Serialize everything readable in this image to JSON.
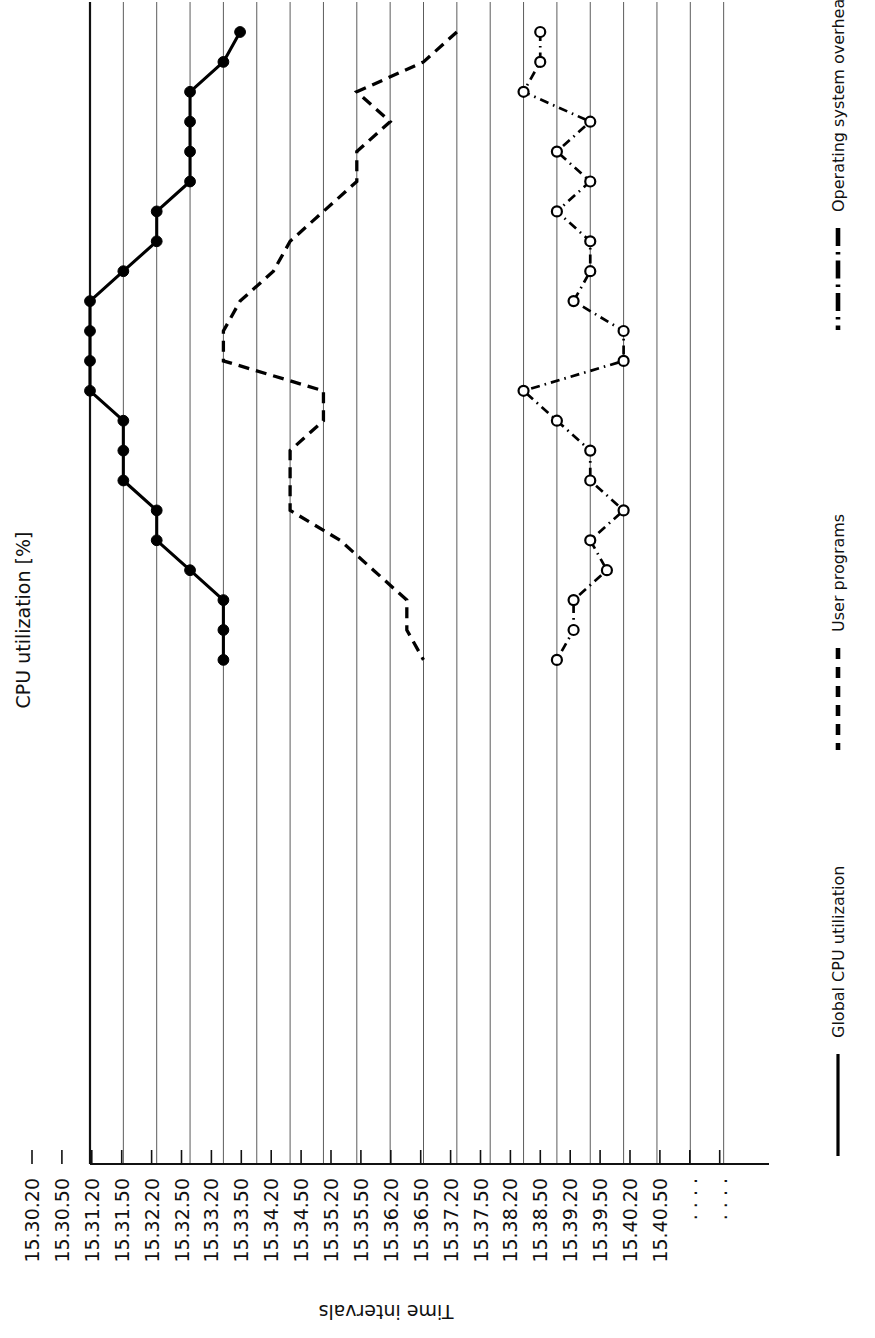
{
  "chart_data": {
    "type": "line",
    "title": "",
    "orientation": "rotated-90",
    "xlabel": "Time intervals",
    "ylabel": "CPU utilization [%]",
    "ylim": [
      0,
      100
    ],
    "ytick_step": 10,
    "grid_step": 5,
    "grid": true,
    "legend_position": "right",
    "ytick_labels": [
      "0",
      "10",
      "20",
      "30",
      "40",
      "50",
      "60",
      "70",
      "80",
      "90",
      "100"
    ],
    "ytick_values": [
      0,
      10,
      20,
      30,
      40,
      50,
      60,
      70,
      80,
      90,
      100
    ],
    "categories": [
      "15.30.20",
      "15.30.50",
      "15.31.20",
      "15.31.50",
      "15.32.20",
      "15.32.50",
      "15.33.20",
      "15.33.50",
      "15.34.20",
      "15.34.50",
      "15.35.20",
      "15.35.50",
      "15.36.20",
      "15.36.50",
      "15.37.20",
      "15.37.50",
      "15.38.20",
      "15.38.50",
      "15.39.20",
      "15.39.50",
      "15.40.20",
      "15.40.50"
    ],
    "trailing_tick_markers": [
      ".  .  .  .",
      ".  .  .  ."
    ],
    "series": [
      {
        "name": "Global CPU utilization",
        "style": "solid",
        "marker": "filled-circle",
        "values": [
          77.5,
          80,
          85,
          85,
          85,
          85,
          90,
          90,
          95,
          100,
          100,
          100,
          100,
          95,
          95,
          95,
          90,
          90,
          85,
          80,
          80,
          80
        ]
      },
      {
        "name": "User programs",
        "style": "dashed",
        "marker": "none",
        "values": [
          45,
          50,
          60,
          55,
          60,
          60,
          65,
          70,
          72.5,
          77.5,
          80,
          80,
          65,
          65,
          70,
          70,
          70,
          62.5,
          57.5,
          52.5,
          52.5,
          50
        ]
      },
      {
        "name": "Operating system overhead",
        "style": "dash-dot",
        "marker": "open-circle",
        "values": [
          32.5,
          32.5,
          35,
          25,
          30,
          25,
          30,
          25,
          25,
          27.5,
          20,
          20,
          35,
          30,
          25,
          25,
          20,
          25,
          22.5,
          27.5,
          27.5,
          30
        ]
      }
    ]
  },
  "legend": {
    "entries": [
      {
        "label": "Operating system overhead",
        "style": "dash-dot"
      },
      {
        "label": "User programs",
        "style": "dashed"
      },
      {
        "label": "Global CPU utilization",
        "style": "solid"
      }
    ]
  }
}
